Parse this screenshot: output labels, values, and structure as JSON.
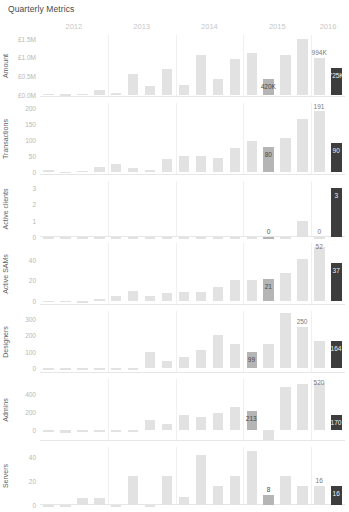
{
  "title": "Quarterly Metrics",
  "years": [
    "2012",
    "2013",
    "2014",
    "2015",
    "2016"
  ],
  "chart_data": {
    "type": "bar",
    "title": "Quarterly Metrics",
    "xlabel": "",
    "grid": true,
    "legend": false,
    "layout": "small-multiples, 7 stacked panels sharing one quarterly x-axis",
    "x": [
      "2012 Q1",
      "2012 Q2",
      "2012 Q3",
      "2012 Q4",
      "2013 Q1",
      "2013 Q2",
      "2013 Q3",
      "2013 Q4",
      "2014 Q1",
      "2014 Q2",
      "2014 Q3",
      "2014 Q4",
      "2015 Q1",
      "2015 Q2",
      "2015 Q3",
      "2015 Q4",
      "2016 Q1",
      "2016 Q2"
    ],
    "x_group_labels": [
      "2012",
      "2013",
      "2014",
      "2015",
      "2016"
    ],
    "highlight_index": 13,
    "current_index": 17,
    "panels": [
      {
        "name": "amount",
        "ylabel": "Amount",
        "yticks": [
          "£0.0M",
          "£0.5M",
          "£1.0M",
          "£1.5M"
        ],
        "ytickvalues": [
          0,
          500000,
          1000000,
          1500000
        ],
        "ylim": [
          -60000,
          1600000
        ],
        "values": [
          30000,
          10000,
          25000,
          130000,
          35000,
          560000,
          240000,
          700000,
          270000,
          1060000,
          430000,
          960000,
          1120000,
          420000,
          1060000,
          1480000,
          994000,
          725000
        ],
        "labels": {
          "13": "420K",
          "16": "994K",
          "17": "725K"
        }
      },
      {
        "name": "transactions",
        "ylabel": "Transactions",
        "yticks": [
          "0",
          "50",
          "100",
          "150",
          "200"
        ],
        "ytickvalues": [
          0,
          50,
          100,
          150,
          200
        ],
        "ylim": [
          -8,
          215
        ],
        "values": [
          9,
          2,
          5,
          18,
          25,
          13,
          6,
          41,
          51,
          51,
          46,
          75,
          98,
          80,
          108,
          165,
          191,
          90
        ],
        "labels": {
          "13": "80",
          "16": "191",
          "17": "90"
        }
      },
      {
        "name": "active_clients",
        "ylabel": "Active clients",
        "yticks": [
          "0",
          "1",
          "2",
          "3"
        ],
        "ytickvalues": [
          0,
          1,
          2,
          3
        ],
        "ylim": [
          0,
          3.4
        ],
        "values": [
          0,
          0,
          0,
          0,
          0,
          0,
          0,
          0,
          0,
          0,
          0,
          0,
          0,
          0,
          0,
          1,
          0,
          3
        ],
        "labels": {
          "13": "0",
          "16": "0",
          "17": "3"
        }
      },
      {
        "name": "active_sams",
        "ylabel": "Active SAMs",
        "yticks": [
          "0",
          "20",
          "40"
        ],
        "ytickvalues": [
          0,
          20,
          40
        ],
        "ylim": [
          -4,
          56
        ],
        "values": [
          -1,
          -1,
          -2,
          2,
          5,
          10,
          5,
          8,
          9,
          9,
          13,
          20,
          20,
          21,
          27,
          41,
          52,
          37
        ],
        "labels": {
          "13": "21",
          "16": "52",
          "17": "37"
        }
      },
      {
        "name": "designers",
        "ylabel": "Designers",
        "yticks": [
          "0",
          "100",
          "200",
          "300"
        ],
        "ytickvalues": [
          0,
          100,
          200,
          300
        ],
        "ylim": [
          -30,
          350
        ],
        "values": [
          0,
          -3,
          -6,
          -5,
          -8,
          -9,
          100,
          42,
          70,
          108,
          205,
          147,
          99,
          147,
          340,
          250,
          164,
          164
        ],
        "labels": {
          "12": "99",
          "15": "250",
          "17": "164"
        }
      },
      {
        "name": "admins",
        "ylabel": "Admins",
        "yticks": [
          "0",
          "200",
          "400"
        ],
        "ytickvalues": [
          0,
          200,
          400
        ],
        "ylim": [
          -120,
          560
        ],
        "values": [
          0,
          -28,
          0,
          -20,
          -10,
          0,
          112,
          62,
          168,
          140,
          182,
          252,
          213,
          -110,
          470,
          500,
          520,
          170
        ],
        "labels": {
          "12": "213",
          "16": "520",
          "17": "170"
        }
      },
      {
        "name": "servers",
        "ylabel": "Servers",
        "yticks": [
          "0",
          "20",
          "40"
        ],
        "ytickvalues": [
          0,
          20,
          40
        ],
        "ylim": [
          0,
          48
        ],
        "values": [
          0,
          0,
          6,
          6,
          0,
          24,
          0,
          24,
          7,
          41,
          16,
          24,
          45,
          8,
          24,
          16,
          16,
          16
        ],
        "labels": {
          "13": "8",
          "16": "16",
          "17": "16"
        }
      }
    ]
  }
}
